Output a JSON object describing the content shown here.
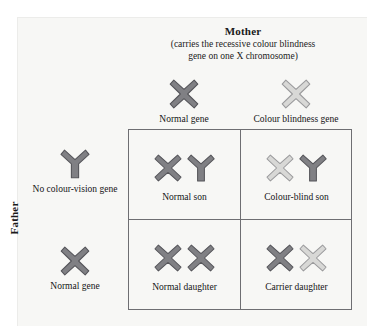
{
  "diagram": {
    "type": "punnett-square",
    "title_mother": "Mother",
    "mother_note_line1": "(carries the recessive colour blindness",
    "mother_note_line2": "gene on one X chromosome)",
    "title_father": "Father",
    "colors": {
      "normal_gene_fill": "#808084",
      "normal_gene_stroke": "#55555a",
      "blind_gene_fill": "#d8d8d6",
      "blind_gene_stroke": "#9a9a9c",
      "grid_line": "#6e6e72",
      "panel_background": "#f7f7f5",
      "text": "#151515"
    },
    "mother_gametes": [
      {
        "label": "Normal gene",
        "chromosome": "X",
        "variant": "normal"
      },
      {
        "label": "Colour blindness gene",
        "chromosome": "X",
        "variant": "blind"
      }
    ],
    "father_gametes": [
      {
        "label": "No colour-vision gene",
        "chromosome": "Y",
        "variant": "normal"
      },
      {
        "label": "Normal gene",
        "chromosome": "X",
        "variant": "normal"
      }
    ],
    "offspring": [
      {
        "label": "Normal son",
        "chromosomes": [
          {
            "shape": "X",
            "variant": "normal"
          },
          {
            "shape": "Y",
            "variant": "normal"
          }
        ]
      },
      {
        "label": "Colour-blind son",
        "chromosomes": [
          {
            "shape": "X",
            "variant": "blind"
          },
          {
            "shape": "Y",
            "variant": "normal"
          }
        ]
      },
      {
        "label": "Normal daughter",
        "chromosomes": [
          {
            "shape": "X",
            "variant": "normal"
          },
          {
            "shape": "X",
            "variant": "normal"
          }
        ]
      },
      {
        "label": "Carrier daughter",
        "chromosomes": [
          {
            "shape": "X",
            "variant": "normal"
          },
          {
            "shape": "X",
            "variant": "blind"
          }
        ]
      }
    ]
  }
}
